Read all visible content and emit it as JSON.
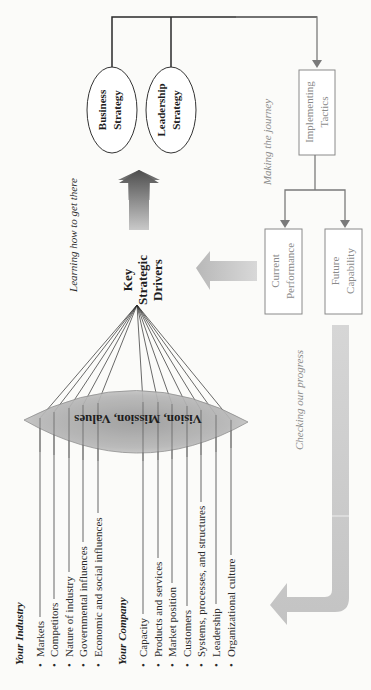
{
  "orientation": "rotated-90-ccw",
  "strategies": [
    {
      "line1": "Business",
      "line2": "Strategy"
    },
    {
      "line1": "Leadership",
      "line2": "Strategy"
    }
  ],
  "tactics": {
    "line1": "Implementing",
    "line2": "Tactics"
  },
  "outcomes": [
    {
      "line1": "Current",
      "line2": "Performance"
    },
    {
      "line1": "Future",
      "line2": "Capability"
    }
  ],
  "drivers": {
    "line1": "Key",
    "line2": "Strategic",
    "line3": "Drivers"
  },
  "lens_label": "Vision, Mission, Values",
  "captions": {
    "learning": "Learning how to get there",
    "journey": "Making the journey",
    "checking": "Checking our progress"
  },
  "industry": {
    "heading": "Your Industry",
    "items": [
      "Markets",
      "Competitors",
      "Nature of industry",
      "Governmental influences",
      "Economic and social influences"
    ]
  },
  "company": {
    "heading": "Your Company",
    "items": [
      "Capacity",
      "Products and services",
      "Market position",
      "Customers",
      "Systems, processes, and structures",
      "Leadership",
      "Organizational culture"
    ]
  },
  "colors": {
    "line_dark": "#2a2a2a",
    "line_gray": "#7a7a7a",
    "text_dark": "#1e1e1e",
    "text_gray": "#8a8a8a",
    "arrow_dark": "#555555",
    "arrow_light": "#c4c4c4",
    "lens": "#a8a8a8"
  }
}
